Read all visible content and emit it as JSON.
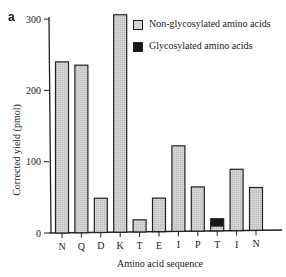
{
  "panel_label": "a",
  "colors": {
    "non_glycosylated_fill": "#d4d4d4",
    "glycosylated_fill": "#151515",
    "axis": "#222222"
  },
  "legend": {
    "items": [
      {
        "label": "Non-glycosylated amino acids",
        "color": "#d4d4d4"
      },
      {
        "label": "Glycosylated amino acids",
        "color": "#151515"
      }
    ]
  },
  "chart_data": {
    "type": "bar",
    "title": "",
    "xlabel": "Amino acid sequence",
    "ylabel": "Corrected yield (pmol)",
    "ylim": [
      0,
      300
    ],
    "yticks": [
      0,
      100,
      200,
      300
    ],
    "grid": false,
    "legend_position": "top-right",
    "categories": [
      "N",
      "Q",
      "D",
      "K",
      "T",
      "E",
      "I",
      "P",
      "T",
      "I",
      "N"
    ],
    "series": [
      {
        "name": "Non-glycosylated amino acids",
        "values": [
          240,
          235,
          48,
          305,
          17,
          47,
          120,
          62,
          7,
          86,
          60
        ]
      },
      {
        "name": "Glycosylated amino acids",
        "values": [
          0,
          0,
          0,
          0,
          0,
          0,
          0,
          0,
          10,
          0,
          0
        ]
      }
    ]
  }
}
